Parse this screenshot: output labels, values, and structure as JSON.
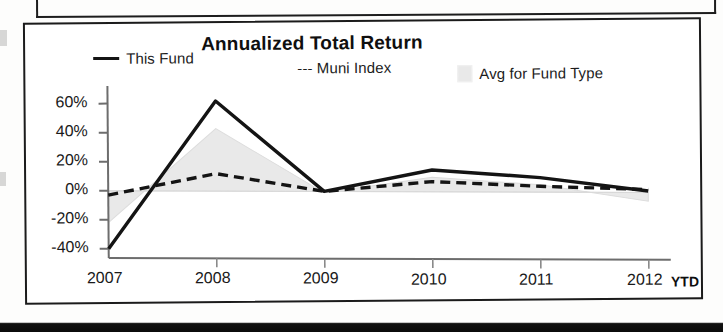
{
  "chart_panel": {
    "title": "Annualized Total Return",
    "legend": [
      {
        "label": "This Fund",
        "marker": "solid-line-swatch"
      },
      {
        "label": "--- Muni Index",
        "marker": "dashed-line-swatch"
      },
      {
        "label": "Avg for Fund Type",
        "marker": "area-swatch"
      }
    ],
    "x_axis_note": "YTD"
  },
  "chart_data": {
    "type": "line",
    "title": "Annualized Total Return",
    "xlabel": "",
    "ylabel": "",
    "categories": [
      "2007",
      "2008",
      "2009",
      "2010",
      "2011",
      "2012"
    ],
    "x_tick_labels": [
      "2007",
      "2008",
      "2009",
      "2010",
      "2011",
      "2012"
    ],
    "y_tick_labels": [
      "60%",
      "40%",
      "20%",
      "0%",
      "-20%",
      "-40%"
    ],
    "y_tick_values": [
      60,
      40,
      20,
      0,
      -20,
      -40
    ],
    "ylim": [
      -45,
      68
    ],
    "grid": false,
    "legend_position": "top",
    "annotations": [
      "YTD"
    ],
    "series": [
      {
        "name": "This Fund",
        "style": "solid",
        "color": "#141414",
        "values": [
          -40,
          62,
          0,
          15,
          10,
          1
        ]
      },
      {
        "name": "Muni Index",
        "style": "dashed",
        "color": "#141414",
        "values": [
          -3,
          12,
          0,
          7,
          4,
          2
        ]
      },
      {
        "name": "Avg for Fund Type",
        "style": "area",
        "color": "#e9e9e9",
        "values": [
          -22,
          43,
          -1,
          10,
          5,
          -6
        ]
      }
    ]
  },
  "colors": {
    "this_fund": "#141414",
    "muni_index": "#141414",
    "avg_fund_type_fill": "#e9e9e9",
    "panel_border": "#1b1b1b",
    "axis": "#5a5a5a"
  }
}
